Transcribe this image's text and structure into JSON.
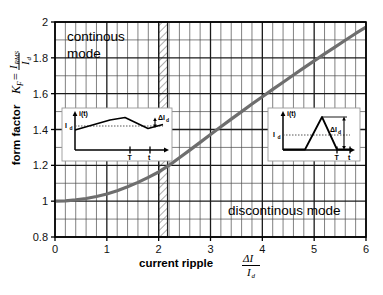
{
  "chart_data": {
    "type": "line",
    "title": "",
    "xlabel": "current ripple",
    "xlabel_fraction": {
      "numerator": "ΔI",
      "denominator": "I",
      "denominator_sub": "d"
    },
    "ylabel": "form factor",
    "ylabel_symbol": "K",
    "ylabel_symbol_sub": "F",
    "ylabel_equals": "=",
    "ylabel_fraction": {
      "numerator": "I",
      "numerator_sub": "RMS",
      "denominator": "I",
      "denominator_sub": "d"
    },
    "xlim": [
      0,
      6
    ],
    "ylim": [
      0.8,
      2
    ],
    "xticks": [
      "0",
      "1",
      "2",
      "3",
      "4",
      "5",
      "6"
    ],
    "yticks": [
      "0.8",
      "1",
      "1.2",
      "1.4",
      "1.6",
      "1.8",
      "2"
    ],
    "x_minor_per_major": 5,
    "y_minor_per_major": 2,
    "grid": true,
    "legend": "none",
    "series": [
      {
        "name": "form factor K_F",
        "color": "#6e6e6e",
        "x": [
          0,
          0.2,
          0.4,
          0.6,
          0.8,
          1.0,
          1.2,
          1.4,
          1.6,
          1.8,
          2.0,
          2.2,
          2.4,
          2.6,
          2.8,
          3.0,
          3.2,
          3.4,
          3.6,
          3.8,
          4.0,
          4.2,
          4.4,
          4.6,
          4.8,
          5.0,
          5.2,
          5.4,
          5.6,
          5.8,
          6.0
        ],
        "y": [
          1.0,
          1.002,
          1.007,
          1.015,
          1.026,
          1.04,
          1.058,
          1.08,
          1.105,
          1.133,
          1.163,
          1.2,
          1.242,
          1.285,
          1.328,
          1.372,
          1.415,
          1.458,
          1.5,
          1.542,
          1.583,
          1.624,
          1.664,
          1.704,
          1.744,
          1.783,
          1.822,
          1.86,
          1.898,
          1.936,
          1.972
        ]
      }
    ],
    "boundary_band": {
      "name": "mode boundary",
      "x_start": 2.0,
      "x_end": 2.17,
      "hatch": true
    },
    "annotations": [
      {
        "name": "continuous-mode-label",
        "text_line1": "continous",
        "text_line2": "mode",
        "x": 0.35,
        "y": 1.92
      },
      {
        "name": "discontinuous-mode-label",
        "text": "discontinous mode",
        "x": 3.55,
        "y": 0.96
      }
    ]
  },
  "insets": {
    "left": {
      "name": "continuous-conduction-waveform",
      "y_axis_label": "i(t)",
      "dc_level_label": "I",
      "dc_level_sub": "d",
      "delta_label": "ΔI",
      "delta_sub": "d",
      "period_label": "T",
      "time_label": "t"
    },
    "right": {
      "name": "discontinuous-conduction-waveform",
      "y_axis_label": "i(t)",
      "dc_level_label": "I",
      "dc_level_sub": "d",
      "delta_label": "ΔI",
      "delta_sub": "d",
      "period_label": "T",
      "time_label": "t"
    }
  },
  "colors": {
    "curve": "#6e6e6e",
    "grid_minor": "#4a4a4a",
    "grid_major": "#1a1a1a",
    "axis": "#000000",
    "background": "#ffffff",
    "inset_bg": "#ffffff",
    "hatch": "#555555"
  }
}
